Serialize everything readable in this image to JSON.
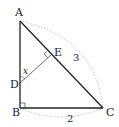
{
  "figure": {
    "type": "geometry",
    "points": {
      "A": {
        "label": "A",
        "x": 20,
        "y": 21
      },
      "B": {
        "label": "B",
        "x": 20,
        "y": 108
      },
      "C": {
        "label": "C",
        "x": 103,
        "y": 108
      },
      "D": {
        "label": "D",
        "x": 20,
        "y": 83
      },
      "E": {
        "label": "E",
        "x": 51,
        "y": 55
      }
    },
    "labels": {
      "A": "A",
      "B": "B",
      "C": "C",
      "D": "D",
      "E": "E",
      "AC_length": "3",
      "BC_length": "2",
      "angle": "x"
    },
    "colors": {
      "line": "#222222",
      "thin_line": "#444444",
      "dotted": "#aaaaaa"
    }
  }
}
